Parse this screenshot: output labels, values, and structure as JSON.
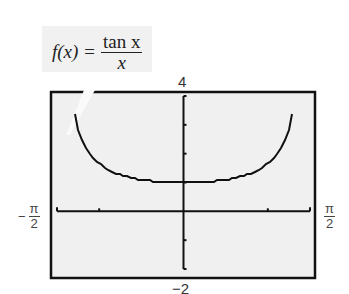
{
  "formula": {
    "lhs": "f(x) =",
    "numerator": "tan x",
    "denominator": "x"
  },
  "window": {
    "ymax_label": "4",
    "ymin_label": "−2",
    "xmin_label": {
      "sign": "−",
      "num": "π",
      "den": "2"
    },
    "xmax_label": {
      "num": "π",
      "den": "2"
    }
  },
  "chart_data": {
    "type": "line",
    "xlabel": "",
    "ylabel": "",
    "xlim": [
      -1.5708,
      1.5708
    ],
    "ylim": [
      -2,
      4
    ],
    "xtick_labels": [
      "-π/2",
      "π/2"
    ],
    "ytick_labels": [
      "-2",
      "4"
    ],
    "x_tick_step": 0.5,
    "y_tick_step": 1,
    "grid": false,
    "series": [
      {
        "name": "tan(x)/x",
        "x": [
          -1.4,
          -1.3,
          -1.2,
          -1.0,
          -0.8,
          -0.6,
          -0.4,
          -0.2,
          0.0,
          0.2,
          0.4,
          0.6,
          0.8,
          1.0,
          1.2,
          1.3,
          1.4
        ],
        "y": [
          4.14,
          2.77,
          2.14,
          1.56,
          1.29,
          1.14,
          1.06,
          1.01,
          1.0,
          1.01,
          1.06,
          1.14,
          1.29,
          1.56,
          2.14,
          2.77,
          4.14
        ]
      }
    ],
    "colors": {
      "background": "#f0f0f0",
      "frame": "#111111",
      "curve": "#111111"
    }
  }
}
